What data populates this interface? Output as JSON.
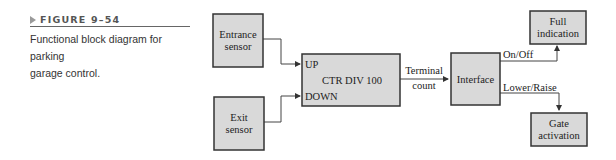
{
  "figure": {
    "label": "FIGURE 9–54",
    "caption_line1": "Functional block diagram for parking",
    "caption_line2": "garage control."
  },
  "diagram": {
    "blocks": {
      "entrance_sensor": {
        "line1": "Entrance",
        "line2": "sensor"
      },
      "exit_sensor": {
        "line1": "Exit",
        "line2": "sensor"
      },
      "counter": {
        "title": "CTR DIV 100",
        "input_up": "UP",
        "input_down": "DOWN"
      },
      "interface": {
        "title": "Interface"
      },
      "full_indication": {
        "line1": "Full",
        "line2": "indication"
      },
      "gate_activation": {
        "line1": "Gate",
        "line2": "activation"
      }
    },
    "signals": {
      "terminal_count_line1": "Terminal",
      "terminal_count_line2": "count",
      "on_off": "On/Off",
      "lower_raise": "Lower/Raise"
    },
    "colors": {
      "block_fill": "#d9d9d9",
      "line": "#333333"
    }
  }
}
